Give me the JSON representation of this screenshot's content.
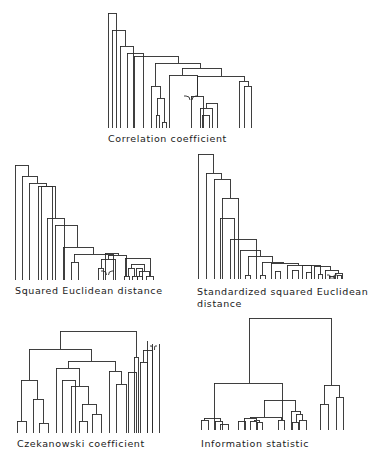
{
  "figure": {
    "panels": [
      {
        "id": "correlation",
        "caption": "Correlation coefficient",
        "caption_pos": [
          108,
          133
        ],
        "leaves_y": 128,
        "links": [
          [
            108,
            116,
            13
          ],
          [
            112,
            125,
            30
          ],
          [
            120,
            133,
            46
          ],
          [
            127,
            143,
            53
          ],
          [
            156,
            159,
            115
          ],
          [
            162,
            166,
            122
          ],
          [
            157,
            164,
            98
          ],
          [
            151,
            160,
            86
          ],
          [
            202,
            209,
            115
          ],
          [
            200,
            212,
            108
          ],
          [
            206,
            217,
            103
          ],
          [
            191,
            203,
            96
          ],
          [
            169,
            197,
            75
          ],
          [
            244,
            251,
            86
          ],
          [
            239,
            248,
            81
          ],
          [
            197,
            244,
            76
          ],
          [
            182,
            221,
            68
          ],
          [
            155,
            200,
            63
          ],
          [
            134,
            178,
            56
          ]
        ],
        "ties": [
          [
            184,
            198,
            96
          ]
        ]
      },
      {
        "id": "squared_euclidean",
        "caption": "Squared Euclidean distance",
        "caption_pos": [
          15,
          285
        ],
        "leaves_y": 280,
        "links": [
          [
            15,
            28,
            165
          ],
          [
            22,
            37,
            176
          ],
          [
            29,
            46,
            183
          ],
          [
            38,
            55,
            186
          ],
          [
            124,
            129,
            276
          ],
          [
            132,
            137,
            276
          ],
          [
            128,
            134,
            268
          ],
          [
            137,
            142,
            276
          ],
          [
            146,
            153,
            276
          ],
          [
            139,
            149,
            271
          ],
          [
            98,
            103,
            268
          ],
          [
            101,
            115,
            259
          ],
          [
            131,
            144,
            264
          ],
          [
            108,
            126,
            255
          ],
          [
            105,
            118,
            253
          ],
          [
            136,
            142,
            268
          ],
          [
            125,
            150,
            258
          ],
          [
            71,
            78,
            262
          ],
          [
            74,
            113,
            254
          ],
          [
            63,
            93,
            247
          ],
          [
            55,
            77,
            225
          ],
          [
            47,
            64,
            218
          ],
          [
            41,
            52,
            186
          ]
        ],
        "ties": [
          [
            101,
            114,
            271
          ]
        ]
      },
      {
        "id": "standardized_squared_euclidean",
        "caption": "Standardized squared Euclidean",
        "caption2": "distance",
        "caption_pos": [
          197,
          286
        ],
        "leaves_y": 279,
        "links": [
          [
            198,
            213,
            154
          ],
          [
            206,
            221,
            173
          ],
          [
            214,
            230,
            179
          ],
          [
            222,
            238,
            198
          ],
          [
            245,
            250,
            275
          ],
          [
            260,
            265,
            275
          ],
          [
            275,
            280,
            271
          ],
          [
            292,
            298,
            270
          ],
          [
            306,
            311,
            272
          ],
          [
            318,
            322,
            274
          ],
          [
            329,
            334,
            276
          ],
          [
            337,
            341,
            275
          ],
          [
            335,
            342,
            273
          ],
          [
            325,
            338,
            270
          ],
          [
            314,
            330,
            266
          ],
          [
            302,
            320,
            265
          ],
          [
            287,
            311,
            265
          ],
          [
            271,
            298,
            263
          ],
          [
            262,
            283,
            262
          ],
          [
            248,
            272,
            256
          ],
          [
            240,
            260,
            250
          ],
          [
            230,
            256,
            239
          ],
          [
            220,
            234,
            218
          ]
        ],
        "ties": [
          [
            327,
            337,
            275
          ]
        ]
      },
      {
        "id": "czekanowski",
        "caption": "Czekanowski coefficient",
        "caption_pos": [
          17,
          438
        ],
        "leaves_y": 433,
        "links": [
          [
            17,
            26,
            421
          ],
          [
            39,
            48,
            423
          ],
          [
            33,
            43,
            399
          ],
          [
            21,
            37,
            380
          ],
          [
            79,
            87,
            421
          ],
          [
            92,
            101,
            414
          ],
          [
            82,
            96,
            404
          ],
          [
            71,
            88,
            386
          ],
          [
            56,
            79,
            368
          ],
          [
            62,
            75,
            380
          ],
          [
            116,
            126,
            384
          ],
          [
            109,
            121,
            371
          ],
          [
            68,
            115,
            361
          ],
          [
            29,
            91,
            349
          ],
          [
            128,
            136,
            372
          ],
          [
            140,
            147,
            362
          ],
          [
            134,
            138,
            357
          ],
          [
            143,
            152,
            350
          ],
          [
            60,
            136,
            331
          ]
        ],
        "extra_verticals": [
          [
            147,
            341,
            433
          ],
          [
            152,
            344,
            433
          ],
          [
            159,
            344,
            433
          ]
        ],
        "ties": [
          [
            150,
            157,
            346
          ]
        ]
      },
      {
        "id": "information_statistic",
        "caption": "Information statistic",
        "caption_pos": [
          201,
          438
        ],
        "leaves_y": 430,
        "links": [
          [
            201,
            208,
            420
          ],
          [
            215,
            222,
            421
          ],
          [
            220,
            228,
            424
          ],
          [
            204,
            220,
            418
          ],
          [
            238,
            245,
            421
          ],
          [
            250,
            256,
            421
          ],
          [
            257,
            262,
            422
          ],
          [
            254,
            259,
            420
          ],
          [
            244,
            256,
            418
          ],
          [
            278,
            284,
            420
          ],
          [
            250,
            281,
            417
          ],
          [
            292,
            298,
            422
          ],
          [
            299,
            306,
            420
          ],
          [
            296,
            302,
            414
          ],
          [
            291,
            300,
            411
          ],
          [
            264,
            295,
            400
          ],
          [
            214,
            282,
            383
          ],
          [
            320,
            328,
            404
          ],
          [
            336,
            343,
            397
          ],
          [
            324,
            339,
            385
          ],
          [
            249,
            331,
            318
          ]
        ],
        "ties": []
      }
    ]
  }
}
